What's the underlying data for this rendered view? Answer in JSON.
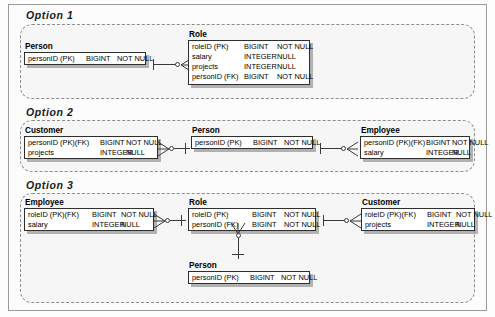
{
  "options": [
    {
      "label": "Option 1",
      "entities": [
        {
          "name": "Person",
          "columns": [
            {
              "name": "personID (PK)",
              "type": "BIGINT",
              "nullability": "NOT NULL"
            }
          ]
        },
        {
          "name": "Role",
          "columns": [
            {
              "name": "roleID (PK)",
              "type": "BIGINT",
              "nullability": "NOT NULL"
            },
            {
              "name": "salary",
              "type": "INTEGER",
              "nullability": "NULL"
            },
            {
              "name": "projects",
              "type": "INTEGER",
              "nullability": "NULL"
            },
            {
              "name": "personID (FK)",
              "type": "BIGINT",
              "nullability": "NOT NULL"
            }
          ]
        }
      ]
    },
    {
      "label": "Option 2",
      "entities": [
        {
          "name": "Customer",
          "columns": [
            {
              "name": "personID (PK)(FK)",
              "type": "BIGINT",
              "nullability": "NOT NULL"
            },
            {
              "name": "projects",
              "type": "INTEGER",
              "nullability": "NULL"
            }
          ]
        },
        {
          "name": "Person",
          "columns": [
            {
              "name": "personID (PK)",
              "type": "BIGINT",
              "nullability": "NOT NULL"
            }
          ]
        },
        {
          "name": "Employee",
          "columns": [
            {
              "name": "personID (PK)(FK)",
              "type": "BIGINT",
              "nullability": "NOT NULL"
            },
            {
              "name": "salary",
              "type": "INTEGER",
              "nullability": "NULL"
            }
          ]
        }
      ]
    },
    {
      "label": "Option 3",
      "entities": [
        {
          "name": "Employee",
          "columns": [
            {
              "name": "roleID (PK)(FK)",
              "type": "BIGINT",
              "nullability": "NOT NULL"
            },
            {
              "name": "salary",
              "type": "INTEGER",
              "nullability": "NULL"
            }
          ]
        },
        {
          "name": "Role",
          "columns": [
            {
              "name": "roleID (PK)",
              "type": "BIGINT",
              "nullability": "NOT NULL"
            },
            {
              "name": "personID (FK)",
              "type": "BIGINT",
              "nullability": "NOT NULL"
            }
          ]
        },
        {
          "name": "Customer",
          "columns": [
            {
              "name": "roleID (PK)(FK)",
              "type": "BIGINT",
              "nullability": "NOT NULL"
            },
            {
              "name": "projects",
              "type": "INTEGER",
              "nullability": "NULL"
            }
          ]
        },
        {
          "name": "Person",
          "columns": [
            {
              "name": "personID (PK)",
              "type": "BIGINT",
              "nullability": "NOT NULL"
            }
          ]
        }
      ]
    }
  ],
  "colors": {
    "panel_bg": "#f6f6f6",
    "panel_border": "#8d8d8d",
    "entity_border": "#2e2e2e",
    "entity_bg": "#ffffff",
    "connector": "#3a3a3a",
    "text": "#000000"
  }
}
